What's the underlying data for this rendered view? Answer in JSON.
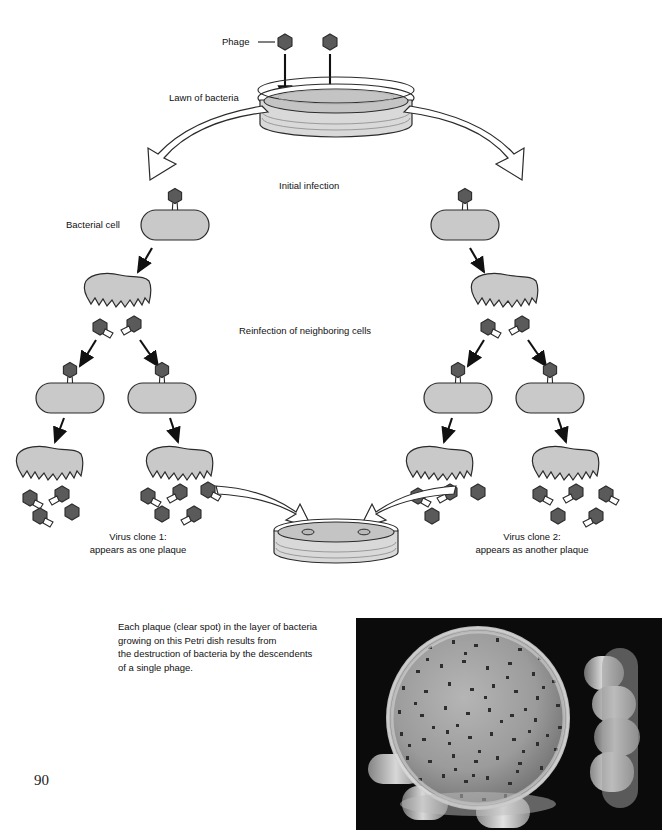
{
  "page": {
    "number": "90",
    "width": 672,
    "height": 836
  },
  "diagram": {
    "title_labels": {
      "phage": "Phage",
      "lawn_of_bacteria": "Lawn of bacteria",
      "initial_infection": "Initial infection",
      "bacterial_cell": "Bacterial cell",
      "reinfection": "Reinfection of neighboring cells",
      "clone1_line1": "Virus clone 1:",
      "clone1_line2": "appears as one plaque",
      "clone2_line1": "Virus clone 2:",
      "clone2_line2": "appears as another plaque"
    },
    "colors": {
      "phage_head": "#5a5a5a",
      "phage_head_dark": "#4a4a4a",
      "bacteria_fill": "#c9c9c9",
      "dish_fill": "#d9d9d9",
      "dish_agar": "#c4c4c4",
      "outline": "#2b2b2b",
      "arrow_fill": "#ffffff",
      "photo_bg": "#0b0b0b"
    }
  },
  "caption": {
    "lines": [
      "Each plaque (clear spot) in the layer of bacteria",
      "growing on this Petri dish results from",
      "the destruction of bacteria by the descendents",
      "of a single phage."
    ]
  },
  "photo": {
    "alt_name": "petri-dish-plaques-photograph",
    "description": "Hand holding a Petri dish with many dark plaques on a bacterial lawn"
  }
}
